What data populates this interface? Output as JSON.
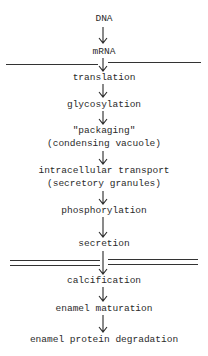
{
  "diagram": {
    "type": "flow",
    "steps": [
      {
        "label": "DNA"
      },
      {
        "label": "mRNA"
      },
      {
        "label": "translation"
      },
      {
        "label": "glycosylation"
      },
      {
        "label": "\"packaging\""
      },
      {
        "label": "(condensing vacuole)"
      },
      {
        "label": "intracellular transport"
      },
      {
        "label": "(secretory granules)"
      },
      {
        "label": "phosphorylation"
      },
      {
        "label": "secretion"
      },
      {
        "label": "calcification"
      },
      {
        "label": "enamel maturation"
      },
      {
        "label": "enamel protein degradation"
      }
    ],
    "dividers": [
      {
        "kind": "single",
        "between": [
          "mRNA",
          "translation"
        ]
      },
      {
        "kind": "double",
        "between": [
          "secretion",
          "calcification"
        ]
      }
    ]
  }
}
